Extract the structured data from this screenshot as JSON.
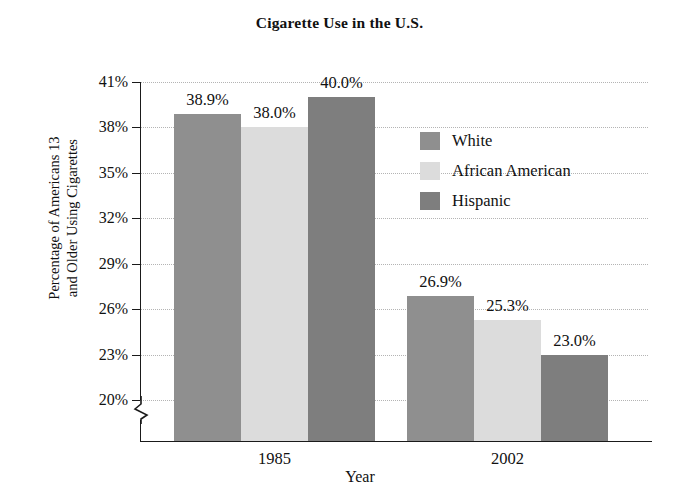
{
  "chart_data": {
    "type": "bar",
    "title": "Cigarette Use in the U.S.",
    "xlabel": "Year",
    "ylabel": "Percentage of Americans 13 and Older Using Cigarettes",
    "ylabel_lines": [
      "Percentage of Americans 13",
      "and Older Using Cigarettes"
    ],
    "categories": [
      "1985",
      "2002"
    ],
    "series": [
      {
        "name": "White",
        "color": "#8f8f8f",
        "values": [
          38.9,
          26.9
        ],
        "value_labels": [
          "38.9%",
          "26.9%"
        ]
      },
      {
        "name": "African American",
        "color": "#dcdcdc",
        "values": [
          38.0,
          25.3
        ],
        "value_labels": [
          "38.0%",
          "25.3%"
        ]
      },
      {
        "name": "Hispanic",
        "color": "#7e7e7e",
        "values": [
          40.0,
          23.0
        ],
        "value_labels": [
          "40.0%",
          "23.0%"
        ]
      }
    ],
    "ylim": [
      20,
      41
    ],
    "y_ticks": [
      41,
      38,
      35,
      32,
      29,
      26,
      23,
      20
    ],
    "y_tick_labels": [
      "41%",
      "38%",
      "35%",
      "32%",
      "29%",
      "26%",
      "23%",
      "20%"
    ],
    "grid": true,
    "axis_break": true,
    "legend_position": "inside-upper-right"
  },
  "legend": {
    "entries": [
      {
        "label": "White",
        "color": "#8f8f8f"
      },
      {
        "label": "African American",
        "color": "#dcdcdc"
      },
      {
        "label": "Hispanic",
        "color": "#7e7e7e"
      }
    ]
  }
}
